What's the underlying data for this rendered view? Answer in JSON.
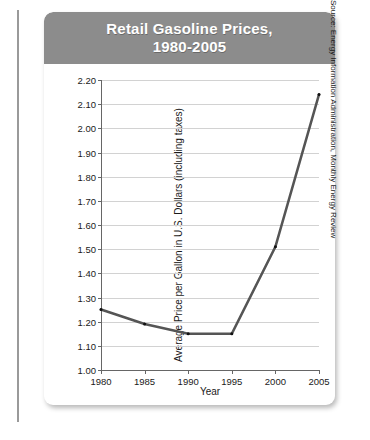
{
  "figure": {
    "title_line1": "Retail Gasoline Prices,",
    "title_line2": "1980-2005",
    "source_note": "Source: Energy Information Administration, Monthly Energy Review",
    "banner_color": "#8c8c8c",
    "line_color": "#555555",
    "grid_color": "#d2d2d2",
    "card_background": "#ffffff"
  },
  "chart_data": {
    "type": "line",
    "title": "Retail Gasoline Prices, 1980-2005",
    "xlabel": "Year",
    "ylabel": "Average Price per Gallon in U.S. Dollars (including taxes)",
    "x": [
      1980,
      1985,
      1990,
      1995,
      2000,
      2005
    ],
    "values": [
      1.25,
      1.19,
      1.15,
      1.15,
      1.51,
      2.14
    ],
    "xlim": [
      1980,
      2005
    ],
    "ylim": [
      1.0,
      2.2
    ],
    "ytick_labels": [
      "2.20",
      "2.10",
      "2.00",
      "1.90",
      "1.80",
      "1.70",
      "1.60",
      "1.50",
      "1.40",
      "1.30",
      "1.20",
      "1.10",
      "1.00"
    ],
    "ytick_values": [
      2.2,
      2.1,
      2.0,
      1.9,
      1.8,
      1.7,
      1.6,
      1.5,
      1.4,
      1.3,
      1.2,
      1.1,
      1.0
    ],
    "xtick_labels": [
      "1980",
      "1985",
      "1990",
      "1995",
      "2000",
      "2005"
    ],
    "xtick_values": [
      1980,
      1985,
      1990,
      1995,
      2000,
      2005
    ],
    "grid": "horizontal",
    "legend": "none",
    "markers": true
  }
}
